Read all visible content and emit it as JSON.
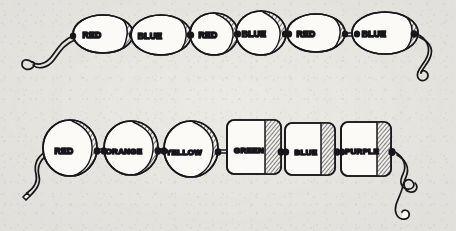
{
  "artwork": {
    "title": "Two strings of lettered beads",
    "medium": "hand-drawn ink illustration on paper",
    "background_color": "#eceae5",
    "ink_color": "#17161a",
    "paper_texture": "mottled aged paper",
    "width": 456,
    "height": 231
  },
  "strands": [
    {
      "name": "top-strand",
      "bead_count": 6,
      "left_end": "curled loose string end with spiral curl",
      "right_end": "curved loose string end with small loop",
      "beads": [
        {
          "label": "RED",
          "shape": "barrel",
          "cx": 103,
          "cy": 34,
          "rx": 30,
          "ry": 19,
          "shade": "right-cap-hatched"
        },
        {
          "label": "BLUE",
          "shape": "barrel",
          "cx": 161,
          "cy": 35,
          "rx": 30,
          "ry": 20,
          "shade": "right-cap-hatched"
        },
        {
          "label": "RED",
          "shape": "round",
          "cx": 214,
          "cy": 34,
          "rx": 24,
          "ry": 21,
          "shade": "right-crescent-hatched"
        },
        {
          "label": "BLUE",
          "shape": "round",
          "cx": 261,
          "cy": 33,
          "rx": 25,
          "ry": 22,
          "shade": "right-crescent-hatched"
        },
        {
          "label": "RED",
          "shape": "barrel",
          "cx": 316,
          "cy": 33,
          "rx": 29,
          "ry": 19,
          "shade": "right-cap-hatched"
        },
        {
          "label": "BLUE",
          "shape": "barrel",
          "cx": 385,
          "cy": 33,
          "rx": 33,
          "ry": 21,
          "shade": "right-cap-hatched"
        }
      ]
    },
    {
      "name": "bottom-strand",
      "bead_count": 6,
      "left_end": "S-curved loose string end, cut tip",
      "right_end": "long curling string end with double loop",
      "beads": [
        {
          "label": "RED",
          "shape": "round",
          "cx": 70,
          "cy": 148,
          "rx": 27,
          "ry": 28,
          "shade": "right-crescent-hatched"
        },
        {
          "label": "ORANGE",
          "shape": "round",
          "cx": 131,
          "cy": 148,
          "rx": 27,
          "ry": 27,
          "shade": "right-crescent-hatched"
        },
        {
          "label": "YELLOW",
          "shape": "round",
          "cx": 191,
          "cy": 149,
          "rx": 27,
          "ry": 28,
          "shade": "right-crescent-hatched"
        },
        {
          "label": "GREEN",
          "shape": "cube",
          "cx": 254,
          "cy": 147,
          "rx": 27,
          "ry": 27,
          "shade": "right-face-hatched"
        },
        {
          "label": "BLUE",
          "shape": "cube",
          "cx": 310,
          "cy": 149,
          "rx": 25,
          "ry": 26,
          "shade": "right-face-hatched"
        },
        {
          "label": "PURPLE",
          "shape": "cube",
          "cx": 366,
          "cy": 149,
          "rx": 25,
          "ry": 27,
          "shade": "right-face-hatched"
        }
      ]
    }
  ],
  "palette": {
    "ink": "#17161a",
    "paper": "#eceae5",
    "bead_fill": "#fbfaf7",
    "hatch": "#3a3a40"
  }
}
